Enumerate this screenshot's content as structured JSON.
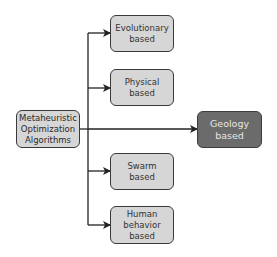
{
  "diagram": {
    "root": {
      "label": "Metaheuristic\nOptimization\nAlgorithms"
    },
    "branches": [
      {
        "label": "Evolutionary\nbased"
      },
      {
        "label": "Physical\nbased"
      },
      {
        "label": "Geology\nbased",
        "highlighted": true
      },
      {
        "label": "Swarm\nbased"
      },
      {
        "label": "Human\nbehavior\nbased"
      }
    ],
    "colors": {
      "box_fill": "#d6d6d6",
      "highlight_fill": "#6b6b6b",
      "stroke": "#2e2e2e"
    }
  }
}
